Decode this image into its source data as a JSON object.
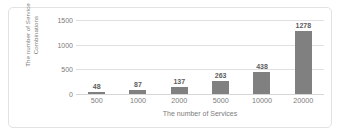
{
  "chart_data": {
    "type": "bar",
    "title": "",
    "categories": [
      "500",
      "1000",
      "2000",
      "5000",
      "10000",
      "20000"
    ],
    "values": [
      48,
      87,
      137,
      263,
      438,
      1278
    ],
    "data_labels": [
      "48",
      "87",
      "137",
      "263",
      "438",
      "1278"
    ],
    "xlabel": "The number of Services",
    "ylabel_line1": "The number of Service",
    "ylabel_line2": "Combinations",
    "ylabel": "The number of Service Combinations",
    "ylim": [
      0,
      1500
    ],
    "yticks": [
      0,
      500,
      1000,
      1500
    ],
    "ytick_labels": [
      "0",
      "500",
      "1000",
      "1500"
    ],
    "grid": true,
    "legend": "none",
    "bar_color": "#808080",
    "gridline_color": "#e0e0e0",
    "text_color": "#7b7b7b",
    "border_color": "#e2e2e2",
    "background_color": "#ffffff"
  }
}
